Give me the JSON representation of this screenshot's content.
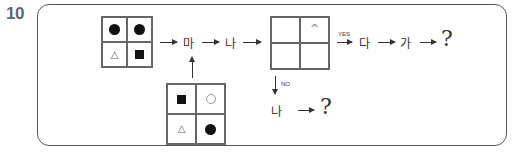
{
  "question_number": "10",
  "grid_input_top": {
    "cells": [
      "filled-circle",
      "filled-circle",
      "open-triangle",
      "filled-square"
    ]
  },
  "grid_input_bottom": {
    "cells": [
      "filled-square",
      "open-circle",
      "open-triangle",
      "filled-circle"
    ]
  },
  "grid_decision": {
    "cells": [
      "",
      "^",
      "",
      ""
    ],
    "caret_symbol": "^"
  },
  "flow_main": {
    "step1": "마",
    "step2": "나",
    "yes_label": "YES",
    "yes_step1": "다",
    "yes_step2": "가",
    "yes_result": "?"
  },
  "flow_no": {
    "no_label": "NO",
    "step1": "나",
    "result": "?"
  },
  "colors": {
    "frame": "#555555",
    "question_number": "#5b6770",
    "symbol": "#111111"
  }
}
